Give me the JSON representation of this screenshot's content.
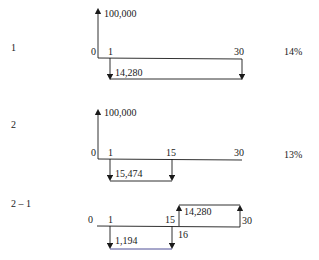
{
  "diagrams": [
    {
      "label": "1",
      "rate": "14%",
      "inflow": {
        "amount": "100,000",
        "period": "0"
      },
      "ticks": {
        "start": "0",
        "first": "1",
        "end": "30"
      },
      "outflow": {
        "amount": "14,280",
        "from": "1",
        "to": "30"
      }
    },
    {
      "label": "2",
      "rate": "13%",
      "inflow": {
        "amount": "100,000",
        "period": "0"
      },
      "ticks": {
        "start": "0",
        "first": "1",
        "mid": "15",
        "end": "30"
      },
      "outflow": {
        "amount": "15,474",
        "from": "1",
        "to": "15"
      }
    },
    {
      "label": "2 – 1",
      "ticks": {
        "start": "0",
        "first": "1",
        "mid": "15",
        "after_mid": "16",
        "end": "30"
      },
      "outflow": {
        "amount": "1,194",
        "from": "1",
        "to": "15"
      },
      "inflow": {
        "amount": "14,280",
        "from": "16",
        "to": "30"
      }
    }
  ]
}
